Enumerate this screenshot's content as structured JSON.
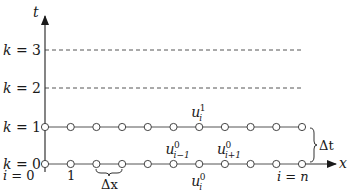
{
  "axes": {
    "x_label": "x",
    "t_label": "t"
  },
  "time_levels": [
    {
      "k": "0",
      "label_var": "k",
      "label_eq": " = ",
      "style": "solid-with-nodes"
    },
    {
      "k": "1",
      "label_var": "k",
      "label_eq": " = ",
      "style": "solid-with-nodes"
    },
    {
      "k": "2",
      "label_var": "k",
      "label_eq": " = ",
      "style": "dashed"
    },
    {
      "k": "3",
      "label_var": "k",
      "label_eq": " = ",
      "style": "dashed"
    }
  ],
  "nodes_per_row": 11,
  "index_labels": {
    "first": {
      "var": "i",
      "eq": " = ",
      "val": "0"
    },
    "second": "1",
    "last": {
      "var": "i",
      "eq": " = ",
      "val": "n"
    }
  },
  "spacing_labels": {
    "dx": "Δx",
    "dt": "Δt"
  },
  "node_annotations": [
    {
      "base": "u",
      "sup": "1",
      "sub": "i",
      "row": 1,
      "node": 6,
      "position": "above"
    },
    {
      "base": "u",
      "sup": "0",
      "sub": "i−1",
      "row": 0,
      "node": 5,
      "position": "above"
    },
    {
      "base": "u",
      "sup": "0",
      "sub": "i+1",
      "row": 0,
      "node": 7,
      "position": "above"
    },
    {
      "base": "u",
      "sup": "0",
      "sub": "i",
      "row": 0,
      "node": 6,
      "position": "below"
    }
  ],
  "colors": {
    "line": "#555555",
    "axis": "#333333",
    "text": "#1a1a1a",
    "node_fill": "#ffffff"
  }
}
